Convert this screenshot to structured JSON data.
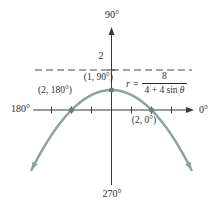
{
  "figure": {
    "axis_labels": {
      "top": "90°",
      "right": "0°",
      "left": "180°",
      "bottom": "270°"
    },
    "point_labels": {
      "vertex": "(1, 90°)",
      "left": "(2, 180°)",
      "right": "(2, 0°)"
    },
    "directrix_label": "2",
    "equation": {
      "lhs_var": "r",
      "equals": "=",
      "numerator": "8",
      "denominator_pre": "4 + 4 sin",
      "denominator_var": "θ"
    },
    "colors": {
      "curve": "#8fa0a0",
      "axis": "#3a3a3a",
      "dot": "#6d7f7f",
      "dashed": "#4a4a4a",
      "text": "#2e2e2e"
    }
  },
  "chart_data": {
    "type": "line",
    "coordinate_system": "polar",
    "equation_text": "r = 8/(4 + 4 sin θ)",
    "cartesian_equivalent": "y = 1 - x²/4",
    "curve": {
      "a": -0.25,
      "b": 0,
      "c": 1,
      "x_range": [
        -4,
        4
      ]
    },
    "points": [
      {
        "label": "(1, 90°)",
        "r": 1,
        "theta_deg": 90
      },
      {
        "label": "(2, 180°)",
        "r": 2,
        "theta_deg": 180
      },
      {
        "label": "(2, 0°)",
        "r": 2,
        "theta_deg": 0
      }
    ],
    "directrix": {
      "y": 2,
      "label": "2",
      "style": "dashed"
    },
    "axes": {
      "theta_labels": [
        "90°",
        "0°",
        "180°",
        "270°"
      ],
      "x_ticks": [
        -3,
        -2,
        -1,
        1,
        2,
        3
      ]
    },
    "xlim": [
      -4.5,
      4.5
    ],
    "ylim": [
      -3.5,
      4.5
    ],
    "grid": false,
    "legend": false
  }
}
